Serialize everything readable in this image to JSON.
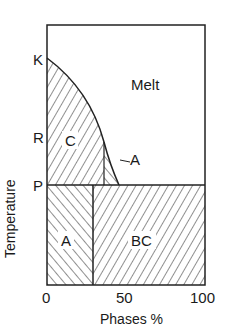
{
  "diagram": {
    "y_axis_label": "Temperature",
    "x_axis_label": "Phases %",
    "x_ticks": [
      "0",
      "50",
      "100"
    ],
    "y_markers": [
      "K",
      "R",
      "P"
    ],
    "regions": {
      "melt": "Melt",
      "c": "C",
      "a_upper": "A",
      "a_lower": "A",
      "bc": "BC"
    }
  }
}
